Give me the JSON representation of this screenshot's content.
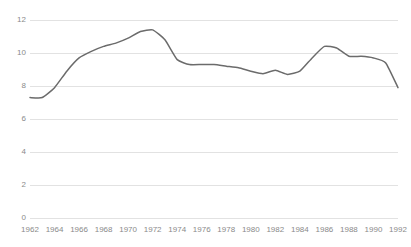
{
  "chart_data": {
    "type": "line",
    "title": "",
    "subtitle": "",
    "xlabel": "",
    "ylabel": "",
    "xlim": [
      1962,
      1992
    ],
    "ylim": [
      0,
      12
    ],
    "grid": true,
    "grid_axis": "y",
    "legend": false,
    "legend_position": "none",
    "line_color": "#6b6b6b",
    "grid_color": "#e2e2e2",
    "tick_label_color": "#8a8a8a",
    "background_color": "#ffffff",
    "y_ticks": [
      0,
      2,
      4,
      6,
      8,
      10,
      12
    ],
    "y_tick_labels": [
      "0",
      "2",
      "4",
      "6",
      "8",
      "10",
      "12"
    ],
    "x_ticks": [
      1962,
      1964,
      1966,
      1968,
      1970,
      1972,
      1974,
      1976,
      1978,
      1980,
      1982,
      1984,
      1986,
      1988,
      1990,
      1992
    ],
    "x_tick_labels": [
      "1962",
      "1964",
      "1966",
      "1968",
      "1970",
      "1972",
      "1974",
      "1976",
      "1978",
      "1980",
      "1982",
      "1984",
      "1986",
      "1988",
      "1990",
      "1992"
    ],
    "series": [
      {
        "name": "series-1",
        "x": [
          1962,
          1963,
          1964,
          1965,
          1966,
          1967,
          1968,
          1969,
          1970,
          1971,
          1972,
          1973,
          1974,
          1975,
          1976,
          1977,
          1978,
          1979,
          1980,
          1981,
          1982,
          1983,
          1984,
          1985,
          1986,
          1987,
          1988,
          1989,
          1990,
          1991,
          1992
        ],
        "values": [
          7.3,
          7.3,
          7.9,
          8.9,
          9.7,
          10.1,
          10.4,
          10.6,
          10.9,
          11.3,
          11.4,
          10.8,
          9.6,
          9.3,
          9.3,
          9.3,
          9.2,
          9.1,
          8.9,
          8.75,
          8.95,
          8.7,
          8.9,
          9.7,
          10.4,
          10.3,
          9.8,
          9.8,
          9.7,
          9.4,
          7.9
        ]
      }
    ]
  }
}
